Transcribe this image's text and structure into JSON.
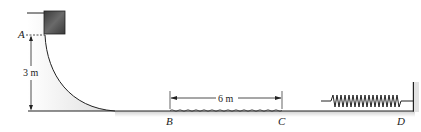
{
  "diagram": {
    "type": "mechanics-figure",
    "points": [
      {
        "id": "A",
        "label": "A"
      },
      {
        "id": "B",
        "label": "B"
      },
      {
        "id": "C",
        "label": "C"
      },
      {
        "id": "D",
        "label": "D"
      }
    ],
    "dimensions": {
      "height": {
        "label": "3 m",
        "from": "A",
        "to": "ground"
      },
      "rough_section": {
        "label": "6 m",
        "from": "B",
        "to": "C"
      }
    },
    "elements": [
      "block",
      "curved-ramp",
      "rough-surface",
      "spring",
      "wall"
    ],
    "colors": {
      "line": "#222222",
      "block": "#555555",
      "shade": "#d9d9d9"
    }
  }
}
